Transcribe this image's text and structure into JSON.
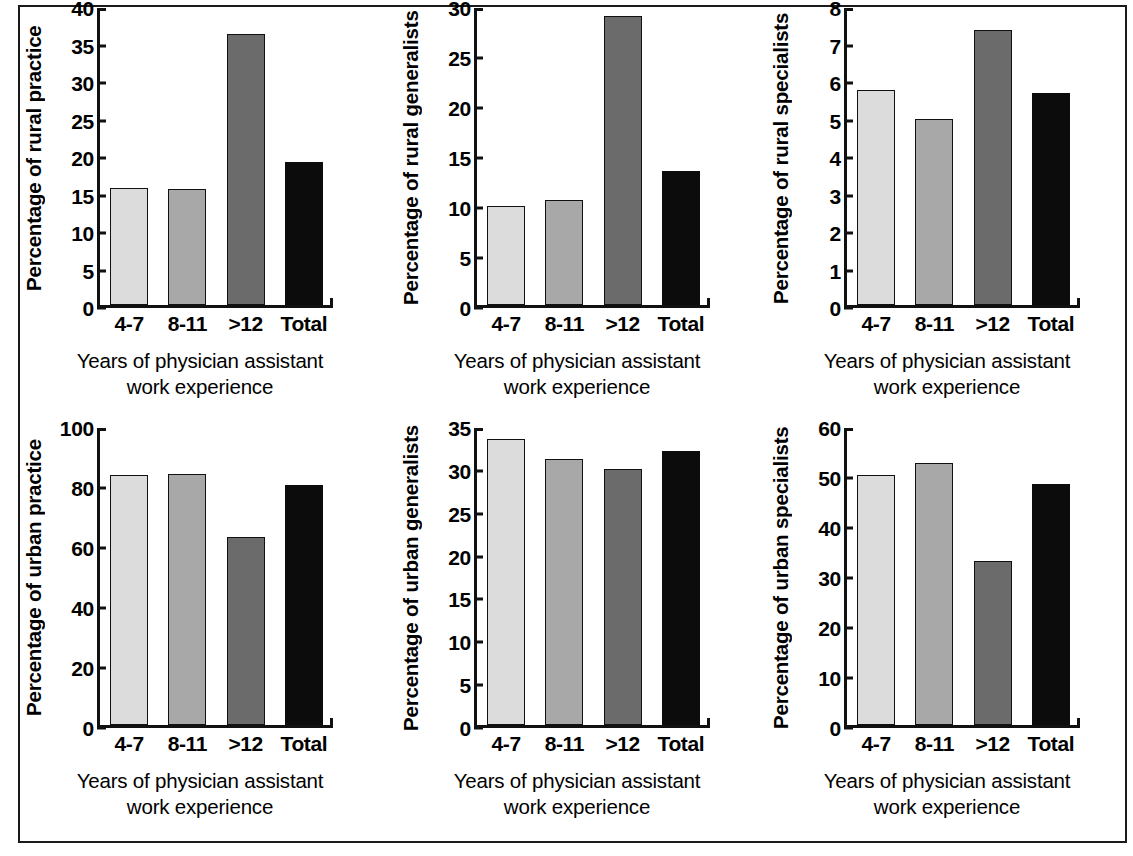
{
  "figure": {
    "frame_color": "#1a1a1a",
    "background": "#ffffff",
    "shared_xlabel_line1": "Years of physician assistant",
    "shared_xlabel_line2": "work experience",
    "categories": [
      "4-7",
      "8-11",
      ">12",
      "Total"
    ],
    "bar_colors": [
      "#dcdcdc",
      "#a8a8a8",
      "#6b6b6b",
      "#0c0c0c"
    ]
  },
  "chart_data": [
    {
      "type": "bar",
      "panel": "top-left",
      "title": "",
      "xlabel": "Years of physician assistant work experience",
      "ylabel": "Percentage of rural practice",
      "categories": [
        "4-7",
        "8-11",
        ">12",
        "Total"
      ],
      "values": [
        15.7,
        15.6,
        36.5,
        19.3
      ],
      "ylim": [
        0,
        40
      ],
      "yticks": [
        0,
        5,
        10,
        15,
        20,
        25,
        30,
        35,
        40
      ],
      "grid": false,
      "legend": "none"
    },
    {
      "type": "bar",
      "panel": "top-middle",
      "title": "",
      "xlabel": "Years of physician assistant work experience",
      "ylabel": "Percentage of rural generalists",
      "categories": [
        "4-7",
        "8-11",
        ">12",
        "Total"
      ],
      "values": [
        10.0,
        10.6,
        29.2,
        13.5
      ],
      "ylim": [
        0,
        30
      ],
      "yticks": [
        0,
        5,
        10,
        15,
        20,
        25,
        30
      ],
      "grid": false,
      "legend": "none"
    },
    {
      "type": "bar",
      "panel": "top-right",
      "title": "",
      "xlabel": "Years of physician assistant work experience",
      "ylabel": "Percentage of rural specialists",
      "categories": [
        "4-7",
        "8-11",
        ">12",
        "Total"
      ],
      "values": [
        5.8,
        5.0,
        7.4,
        5.7
      ],
      "ylim": [
        0,
        8
      ],
      "yticks": [
        0,
        1,
        2,
        3,
        4,
        5,
        6,
        7,
        8
      ],
      "grid": false,
      "legend": "none"
    },
    {
      "type": "bar",
      "panel": "bottom-left",
      "title": "",
      "xlabel": "Years of physician assistant work experience",
      "ylabel": "Percentage of urban practice",
      "categories": [
        "4-7",
        "8-11",
        ">12",
        "Total"
      ],
      "values": [
        84.1,
        84.4,
        63.4,
        80.9
      ],
      "ylim": [
        0,
        100
      ],
      "yticks": [
        0,
        20,
        40,
        60,
        80,
        100
      ],
      "grid": false,
      "legend": "none"
    },
    {
      "type": "bar",
      "panel": "bottom-middle",
      "title": "",
      "xlabel": "Years of physician assistant work experience",
      "ylabel": "Percentage of urban generalists",
      "categories": [
        "4-7",
        "8-11",
        ">12",
        "Total"
      ],
      "values": [
        33.7,
        31.4,
        30.2,
        32.3
      ],
      "ylim": [
        0,
        35
      ],
      "yticks": [
        0,
        5,
        10,
        15,
        20,
        25,
        30,
        35
      ],
      "grid": false,
      "legend": "none"
    },
    {
      "type": "bar",
      "panel": "bottom-right",
      "title": "",
      "xlabel": "Years of physician assistant work experience",
      "ylabel": "Percentage of urban specialists",
      "categories": [
        "4-7",
        "8-11",
        ">12",
        "Total"
      ],
      "values": [
        50.5,
        53.0,
        33.2,
        48.6
      ],
      "ylim": [
        0,
        60
      ],
      "yticks": [
        0,
        10,
        20,
        30,
        40,
        50,
        60
      ],
      "grid": false,
      "legend": "none"
    }
  ]
}
